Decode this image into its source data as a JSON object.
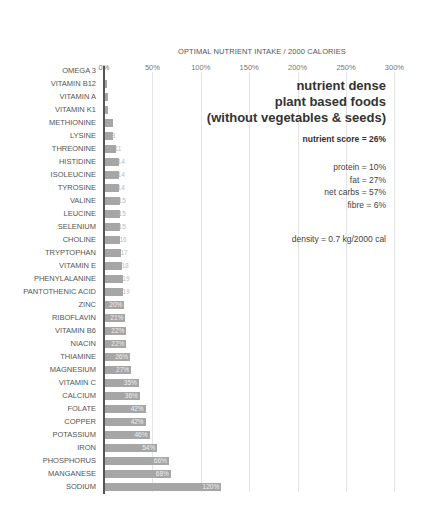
{
  "chart_data": {
    "type": "bar",
    "orientation": "horizontal",
    "title": "OPTIMAL NUTRIENT INTAKE / 2000 CALORIES",
    "xlabel": "",
    "ylabel": "",
    "xlim": [
      0,
      300
    ],
    "x_ticks": [
      "0%",
      "50%",
      "100%",
      "150%",
      "200%",
      "250%",
      "300%"
    ],
    "grid": true,
    "legend": "none",
    "categories": [
      "OMEGA 3",
      "VITAMIN B12",
      "VITAMIN A",
      "VITAMIN K1",
      "METHIONINE",
      "LYSINE",
      "THREONINE",
      "HISTIDINE",
      "ISOLEUCINE",
      "TYROSINE",
      "VALINE",
      "LEUCINE",
      "SELENIUM",
      "CHOLINE",
      "TRYPTOPHAN",
      "VITAMIN E",
      "PHENYLALANINE",
      "PANTOTHENIC ACID",
      "ZINC",
      "RIBOFLAVIN",
      "VITAMIN B6",
      "NIACIN",
      "THIAMINE",
      "MAGNESIUM",
      "VITAMIN C",
      "CALCIUM",
      "FOLATE",
      "COPPER",
      "POTASSIUM",
      "IRON",
      "PHOSPHORUS",
      "MANGANESE",
      "SODIUM"
    ],
    "values": [
      0,
      2,
      3,
      3,
      8,
      8,
      11,
      14,
      14,
      14,
      15,
      15,
      15,
      16,
      17,
      18,
      19,
      19,
      20,
      21,
      22,
      22,
      26,
      27,
      35,
      36,
      42,
      42,
      46,
      54,
      66,
      68,
      120
    ],
    "value_labels": [
      "",
      "",
      "",
      "",
      "",
      "8",
      "11",
      "14",
      "14",
      "14",
      "15",
      "15",
      "15",
      "16",
      "17",
      "18",
      "19",
      "19",
      "20%",
      "21%",
      "22%",
      "22%",
      "26%",
      "27%",
      "35%",
      "36%",
      "42%",
      "42%",
      "46%",
      "54%",
      "66%",
      "68%",
      "120%"
    ]
  },
  "annotations": {
    "heading": [
      "nutrient dense",
      "plant based foods",
      "(without vegetables & seeds)"
    ],
    "nutrient_score": "nutrient score = 26%",
    "protein": "protein = 10%",
    "fat": "fat = 27%",
    "net_carbs": "net carbs = 57%",
    "fibre": "fibre = 6%",
    "density": "density = 0.7 kg/2000 cal"
  },
  "colors": {
    "bar": "#a6a6a6",
    "axis": "#555555",
    "grid": "#e4e4e4"
  }
}
